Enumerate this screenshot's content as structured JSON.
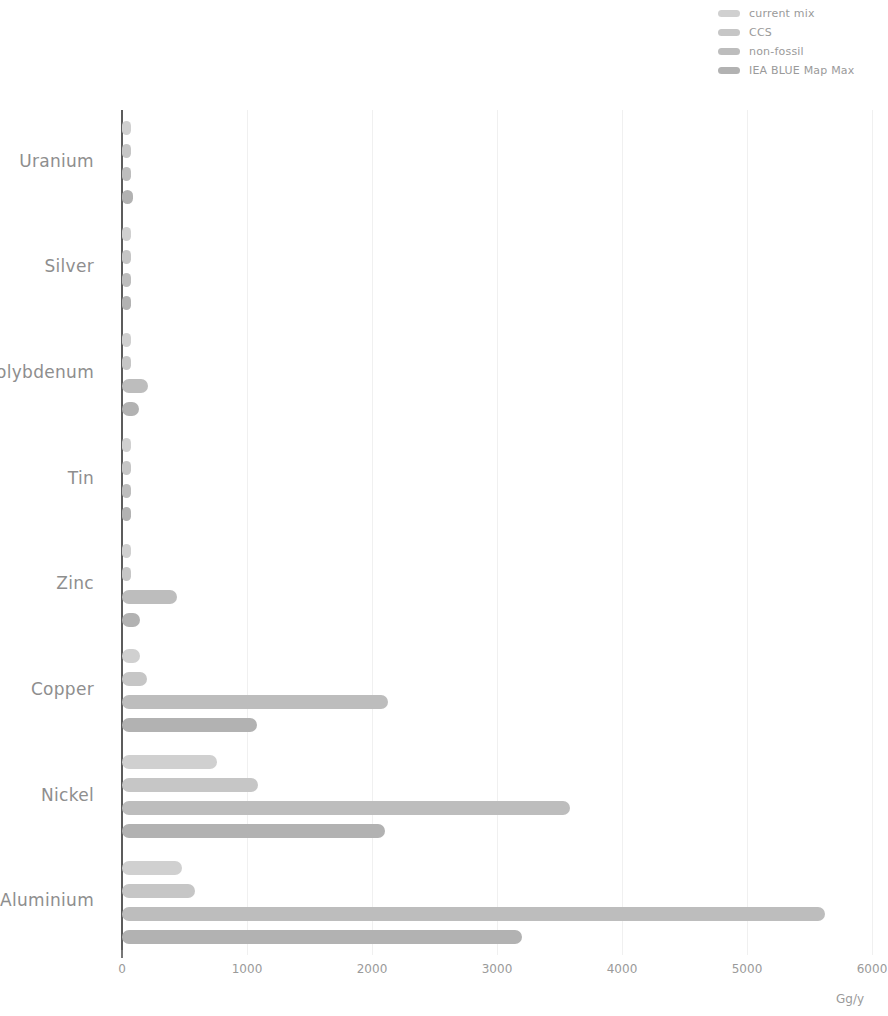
{
  "legend": {
    "position": "top-right",
    "entries": [
      {
        "label": "current mix",
        "color": "#d0d0d0"
      },
      {
        "label": "CCS",
        "color": "#c6c6c6"
      },
      {
        "label": "non-fossil",
        "color": "#bdbdbd"
      },
      {
        "label": "IEA BLUE Map Max",
        "color": "#b2b2b2"
      }
    ]
  },
  "axis": {
    "unit_label": "Gg/y",
    "x_ticks": [
      "0",
      "1000",
      "2000",
      "3000",
      "4000",
      "5000",
      "6000"
    ]
  },
  "chart_data": {
    "type": "bar",
    "orientation": "horizontal",
    "title": "",
    "xlabel": "Gg/y",
    "ylabel": "",
    "xlim": [
      0,
      6000
    ],
    "grid": true,
    "legend_position": "top-right",
    "categories": [
      "Uranium",
      "Silver",
      "Molybdenum",
      "Tin",
      "Zinc",
      "Copper",
      "Nickel",
      "Aluminium"
    ],
    "series": [
      {
        "name": "current mix",
        "color": "#d0d0d0",
        "values": [
          15,
          4,
          20,
          3,
          10,
          145,
          760,
          480
        ]
      },
      {
        "name": "CCS",
        "color": "#c6c6c6",
        "values": [
          22,
          5,
          32,
          4,
          16,
          200,
          1090,
          580
        ]
      },
      {
        "name": "non-fossil",
        "color": "#bdbdbd",
        "values": [
          55,
          6,
          205,
          5,
          440,
          2130,
          3580,
          5620
        ]
      },
      {
        "name": "IEA BLUE Map Max",
        "color": "#b2b2b2",
        "values": [
          85,
          5,
          135,
          4,
          140,
          1080,
          2100,
          3200
        ]
      }
    ]
  }
}
